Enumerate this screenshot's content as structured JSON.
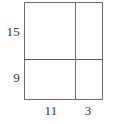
{
  "figure": {
    "kind": "partitioned-rectangle-area-model",
    "colors": {
      "background": "#ffffff",
      "stroke": "#6f6f6f",
      "divider_stroke": "#5a5a5a",
      "text": "#3a3a3a"
    },
    "outer_rectangle": {
      "x": 24,
      "y": 2,
      "width": 79,
      "height": 98
    },
    "dividers": {
      "horizontal_y": 59,
      "vertical_x": 75
    },
    "height_labels": [
      {
        "value": "15",
        "segment": "top"
      },
      {
        "value": "9",
        "segment": "bottom"
      }
    ],
    "width_labels": [
      {
        "value": "11",
        "segment": "left"
      },
      {
        "value": "3",
        "segment": "right"
      }
    ]
  },
  "chart_data": {
    "type": "table",
    "title": "",
    "xlabel": "",
    "ylabel": "",
    "column_headers": [
      "11",
      "3"
    ],
    "row_headers": [
      "15",
      "9"
    ],
    "column_widths": [
      11,
      3
    ],
    "row_heights": [
      15,
      9
    ],
    "cells": [
      [
        "",
        ""
      ],
      [
        "",
        ""
      ]
    ]
  }
}
